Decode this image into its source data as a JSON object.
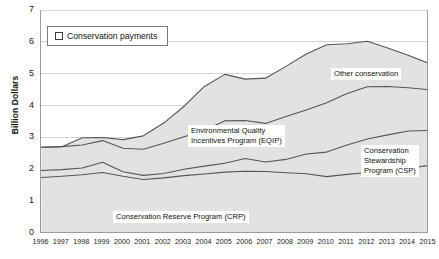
{
  "legend": {
    "label": "Conservation payments",
    "marker": "square-marker"
  },
  "axes": {
    "y_title": "Billion Dollars",
    "y_ticks": [
      "0",
      "1",
      "2",
      "3",
      "4",
      "5",
      "6",
      "7"
    ],
    "x_ticks": [
      "1996",
      "1997",
      "1998",
      "1999",
      "2000",
      "2001",
      "2002",
      "2003",
      "2004",
      "2005",
      "2006",
      "2007",
      "2008",
      "2009",
      "2010",
      "2011",
      "2012",
      "2013",
      "2014",
      "2015"
    ]
  },
  "callouts": {
    "other": "Other conservation",
    "eqip": "Environmental Quality\nIncentives Program (EQIP)",
    "csp": "Conservation\nStewardship\nProgram (CSP)",
    "crp": "Conservation Reserve Program (CRP)"
  },
  "chart_data": {
    "type": "area",
    "stacked": true,
    "title": "",
    "xlabel": "",
    "ylabel": "Billion Dollars",
    "ylim": [
      0,
      7
    ],
    "grid": true,
    "legend_position": "top-left",
    "legend_entries": [
      "Conservation payments"
    ],
    "x": [
      1996,
      1997,
      1998,
      1999,
      2000,
      2001,
      2002,
      2003,
      2004,
      2005,
      2006,
      2007,
      2008,
      2009,
      2010,
      2011,
      2012,
      2013,
      2014,
      2015
    ],
    "series": [
      {
        "name": "Conservation Reserve Program (CRP)",
        "values": [
          1.74,
          1.78,
          1.83,
          1.9,
          1.78,
          1.68,
          1.73,
          1.8,
          1.85,
          1.91,
          1.94,
          1.93,
          1.89,
          1.86,
          1.77,
          1.84,
          1.9,
          1.96,
          2.03,
          2.12
        ]
      },
      {
        "name": "Conservation Stewardship Program (CSP)",
        "values": [
          0.22,
          0.21,
          0.21,
          0.32,
          0.14,
          0.13,
          0.14,
          0.2,
          0.25,
          0.28,
          0.4,
          0.3,
          0.42,
          0.62,
          0.77,
          0.92,
          1.05,
          1.12,
          1.17,
          1.1
        ]
      },
      {
        "name": "Environmental Quality Incentives Program (EQIP)",
        "values": [
          0.73,
          0.72,
          0.72,
          0.68,
          0.74,
          0.82,
          0.95,
          1.02,
          1.12,
          1.33,
          1.19,
          1.21,
          1.35,
          1.38,
          1.55,
          1.62,
          1.64,
          1.52,
          1.36,
          1.28
        ]
      },
      {
        "name": "Other conservation",
        "values": [
          0.0,
          0.0,
          0.23,
          0.1,
          0.27,
          0.42,
          0.63,
          0.96,
          1.38,
          1.46,
          1.3,
          1.42,
          1.57,
          1.76,
          1.82,
          1.56,
          1.43,
          1.21,
          1.02,
          0.83
        ]
      }
    ],
    "totals": [
      2.69,
      2.71,
      2.99,
      3.0,
      2.93,
      3.05,
      3.45,
      3.98,
      4.6,
      4.98,
      4.83,
      4.86,
      5.23,
      5.62,
      5.91,
      5.94,
      6.02,
      5.81,
      5.58,
      5.33
    ]
  }
}
